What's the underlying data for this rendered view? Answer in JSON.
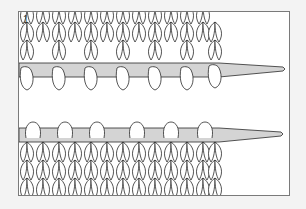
{
  "illustration": {
    "subject": "knitting stitches on needles",
    "step_number": "1",
    "colors": {
      "background": "#f3f3f3",
      "panel": "#ffffff",
      "frame": "#7a7a7a",
      "needle": "#d4d4d4",
      "outline": "#2a2a2a",
      "yarn": "#ffffff"
    }
  }
}
